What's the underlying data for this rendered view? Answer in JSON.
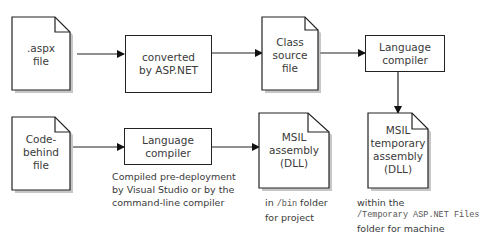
{
  "nodes": {
    "aspx_file": {
      "type": "document",
      "lines": [
        ".aspx",
        "file"
      ]
    },
    "converted": {
      "type": "process",
      "lines": [
        "converted",
        "by ASP.NET"
      ]
    },
    "class_source": {
      "type": "document",
      "lines": [
        "Class",
        "source",
        "file"
      ]
    },
    "lang_compiler_top": {
      "type": "process",
      "lines": [
        "Language",
        "compiler"
      ]
    },
    "msil_temp": {
      "type": "document",
      "lines": [
        "MSIL",
        "temporary",
        "assembly",
        "(DLL)"
      ]
    },
    "code_behind": {
      "type": "document",
      "lines": [
        "Code-",
        "behind",
        "file"
      ]
    },
    "lang_compiler_bottom": {
      "type": "process",
      "lines": [
        "Language",
        "compiler"
      ]
    },
    "msil_assembly": {
      "type": "document",
      "lines": [
        "MSIL",
        "assembly",
        "(DLL)"
      ]
    }
  },
  "captions": {
    "compiled": [
      "Compiled pre-deployment",
      "by Visual Studio or by the",
      "command-line compiler"
    ],
    "bin": {
      "pre": "in ",
      "code": "/bin",
      "post": " folder",
      "line2": "for project"
    },
    "temp": {
      "line1": "within the",
      "code": "/Temporary ASP.NET Files",
      "line3": "folder for machine"
    }
  },
  "edges": [
    {
      "from": "aspx_file",
      "to": "converted"
    },
    {
      "from": "converted",
      "to": "class_source"
    },
    {
      "from": "class_source",
      "to": "lang_compiler_top"
    },
    {
      "from": "lang_compiler_top",
      "to": "msil_temp"
    },
    {
      "from": "code_behind",
      "to": "lang_compiler_bottom"
    },
    {
      "from": "lang_compiler_bottom",
      "to": "msil_assembly"
    }
  ]
}
